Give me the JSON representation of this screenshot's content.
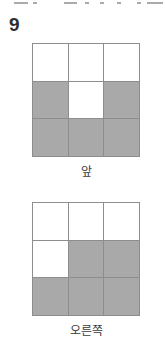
{
  "page": {
    "background_color": "#ffffff",
    "width": 165,
    "height": 349,
    "top_cut_text": ""
  },
  "problem": {
    "number": "9"
  },
  "palette": {
    "filled_cell": "#a9a9a9",
    "empty_cell": "#ffffff",
    "grid_line": "#8d8d8d",
    "text": "#3a3a3a",
    "number_text": "#2e2e2e"
  },
  "figures": [
    {
      "id": "front-view",
      "caption": "앞",
      "rows": 3,
      "cols": 3,
      "cells": [
        [
          "white",
          "white",
          "white"
        ],
        [
          "gray",
          "white",
          "gray"
        ],
        [
          "gray",
          "gray",
          "gray"
        ]
      ]
    },
    {
      "id": "right-view",
      "caption": "오른쪽",
      "rows": 3,
      "cols": 3,
      "cells": [
        [
          "white",
          "white",
          "white"
        ],
        [
          "white",
          "gray",
          "gray"
        ],
        [
          "gray",
          "gray",
          "gray"
        ]
      ]
    }
  ]
}
